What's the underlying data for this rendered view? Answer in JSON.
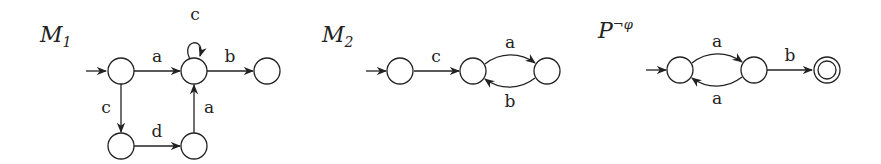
{
  "diagrams": [
    {
      "id": "M1",
      "title": {
        "main": "M",
        "sub": "1"
      },
      "nodes": [
        {
          "id": "m1_s0",
          "initial": true,
          "accepting": false
        },
        {
          "id": "m1_s1",
          "initial": false,
          "accepting": false
        },
        {
          "id": "m1_s2",
          "initial": false,
          "accepting": false
        },
        {
          "id": "m1_s3",
          "initial": false,
          "accepting": false
        },
        {
          "id": "m1_s4",
          "initial": false,
          "accepting": false
        }
      ],
      "edges": [
        {
          "from": "m1_s0",
          "to": "m1_s1",
          "label": "a"
        },
        {
          "from": "m1_s1",
          "to": "m1_s1",
          "label": "c"
        },
        {
          "from": "m1_s1",
          "to": "m1_s2",
          "label": "b"
        },
        {
          "from": "m1_s0",
          "to": "m1_s3",
          "label": "c"
        },
        {
          "from": "m1_s3",
          "to": "m1_s4",
          "label": "d"
        },
        {
          "from": "m1_s4",
          "to": "m1_s1",
          "label": "a"
        }
      ]
    },
    {
      "id": "M2",
      "title": {
        "main": "M",
        "sub": "2"
      },
      "nodes": [
        {
          "id": "m2_s0",
          "initial": true,
          "accepting": false
        },
        {
          "id": "m2_s1",
          "initial": false,
          "accepting": false
        },
        {
          "id": "m2_s2",
          "initial": false,
          "accepting": false
        }
      ],
      "edges": [
        {
          "from": "m2_s0",
          "to": "m2_s1",
          "label": "c"
        },
        {
          "from": "m2_s1",
          "to": "m2_s2",
          "label": "a"
        },
        {
          "from": "m2_s2",
          "to": "m2_s1",
          "label": "b"
        }
      ]
    },
    {
      "id": "P_not_phi",
      "title": {
        "main": "P",
        "sup": "¬φ"
      },
      "nodes": [
        {
          "id": "p_s0",
          "initial": true,
          "accepting": false
        },
        {
          "id": "p_s1",
          "initial": false,
          "accepting": false
        },
        {
          "id": "p_s2",
          "initial": false,
          "accepting": true
        }
      ],
      "edges": [
        {
          "from": "p_s0",
          "to": "p_s1",
          "label": "a"
        },
        {
          "from": "p_s1",
          "to": "p_s0",
          "label": "a"
        },
        {
          "from": "p_s1",
          "to": "p_s2",
          "label": "b"
        }
      ]
    }
  ]
}
